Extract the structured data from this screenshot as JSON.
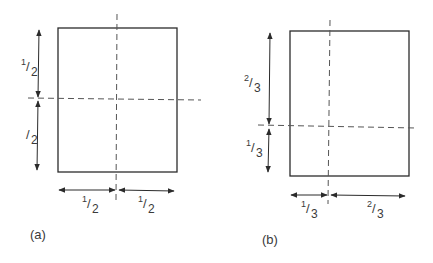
{
  "panels": [
    {
      "id": "a",
      "caption": "(a)",
      "vertical_split": {
        "top": {
          "num": "1",
          "den": "2"
        },
        "bottom": {
          "num": "",
          "den": "2"
        }
      },
      "horizontal_split": {
        "left": {
          "num": "1",
          "den": "2"
        },
        "right": {
          "num": "1",
          "den": "2"
        }
      }
    },
    {
      "id": "b",
      "caption": "(b)",
      "vertical_split": {
        "top": {
          "num": "2",
          "den": "3"
        },
        "bottom": {
          "num": "1",
          "den": "3"
        }
      },
      "horizontal_split": {
        "left": {
          "num": "1",
          "den": "3"
        },
        "right": {
          "num": "2",
          "den": "3"
        }
      }
    }
  ],
  "colors": {
    "line": "#2b2b2b",
    "dash": "#555555",
    "background": "#ffffff"
  }
}
